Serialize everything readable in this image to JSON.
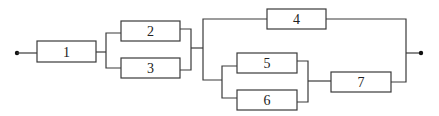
{
  "diagram": {
    "type": "reliability-block-diagram",
    "colors": {
      "line": "#3a3a3a",
      "text": "#222222",
      "background": "#ffffff"
    },
    "terminals": [
      {
        "id": "input",
        "x": 17,
        "y": 53
      },
      {
        "id": "output",
        "x": 421,
        "y": 53
      }
    ],
    "blocks": [
      {
        "id": "1",
        "label": "1",
        "x": 37,
        "y": 41,
        "w": 59,
        "h": 21
      },
      {
        "id": "2",
        "label": "2",
        "x": 121,
        "y": 21,
        "w": 59,
        "h": 20
      },
      {
        "id": "3",
        "label": "3",
        "x": 121,
        "y": 58,
        "w": 59,
        "h": 20
      },
      {
        "id": "4",
        "label": "4",
        "x": 267,
        "y": 9,
        "w": 59,
        "h": 20
      },
      {
        "id": "5",
        "label": "5",
        "x": 237,
        "y": 53,
        "w": 60,
        "h": 20
      },
      {
        "id": "6",
        "label": "6",
        "x": 237,
        "y": 90,
        "w": 60,
        "h": 20
      },
      {
        "id": "7",
        "label": "7",
        "x": 331,
        "y": 72,
        "w": 60,
        "h": 20
      }
    ],
    "structure": "1 -> (2 || 3) -> (4 || ((5 || 6) -> 7))"
  }
}
